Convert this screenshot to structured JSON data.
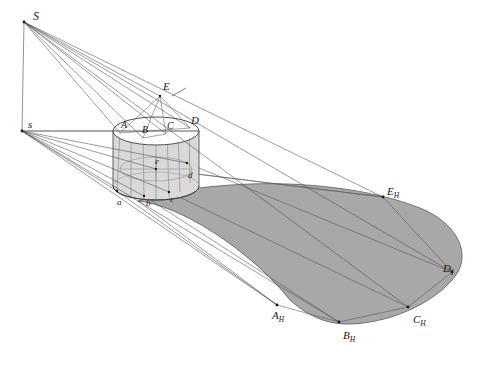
{
  "figure": {
    "background_color": "#ffffff",
    "line_color": "#3c3c3c",
    "shadow_fill": "#a8a8a8",
    "cylinder_fill": "#d8d8d8",
    "top_ellipse_fill": "#ffffff"
  },
  "labels": [
    {
      "id": "S",
      "text": "S",
      "sub": "",
      "x": 33,
      "y": 10,
      "size": 11
    },
    {
      "id": "s",
      "text": "s",
      "sub": "",
      "x": 28,
      "y": 119,
      "size": 10
    },
    {
      "id": "E",
      "text": "E",
      "sub": "",
      "x": 163,
      "y": 82,
      "size": 10
    },
    {
      "id": "A",
      "text": "A",
      "sub": "",
      "x": 122,
      "y": 121,
      "size": 10
    },
    {
      "id": "B",
      "text": "B",
      "sub": "",
      "x": 143,
      "y": 126,
      "size": 10
    },
    {
      "id": "C",
      "text": "C",
      "sub": "",
      "x": 168,
      "y": 122,
      "size": 10
    },
    {
      "id": "D",
      "text": "D",
      "sub": "",
      "x": 192,
      "y": 116,
      "size": 10
    },
    {
      "id": "e",
      "text": "e",
      "sub": "",
      "x": 155,
      "y": 158,
      "size": 9
    },
    {
      "id": "d",
      "text": "d",
      "sub": "",
      "x": 188,
      "y": 173,
      "size": 9
    },
    {
      "id": "a",
      "text": "a",
      "sub": "",
      "x": 117,
      "y": 199,
      "size": 9
    },
    {
      "id": "b",
      "text": "b",
      "sub": "",
      "x": 146,
      "y": 200,
      "size": 9
    },
    {
      "id": "c",
      "text": "c",
      "sub": "",
      "x": 170,
      "y": 196,
      "size": 9
    },
    {
      "id": "EH",
      "text": "E",
      "sub": "H",
      "x": 387,
      "y": 188,
      "size": 10
    },
    {
      "id": "DH",
      "text": "D",
      "sub": "I",
      "x": 443,
      "y": 265,
      "size": 10
    },
    {
      "id": "CH",
      "text": "C",
      "sub": "H",
      "x": 413,
      "y": 316,
      "size": 10
    },
    {
      "id": "BH",
      "text": "B",
      "sub": "H",
      "x": 343,
      "y": 332,
      "size": 10
    },
    {
      "id": "AH",
      "text": "A",
      "sub": "H",
      "x": 272,
      "y": 312,
      "size": 10
    }
  ],
  "points": {
    "S": [
      24,
      22
    ],
    "s": [
      22,
      131
    ],
    "E_top": [
      160,
      96
    ],
    "A_top": [
      120,
      133
    ],
    "B_top": [
      143,
      138
    ],
    "C_top": [
      166,
      134
    ],
    "D_top": [
      190,
      128
    ],
    "e_bot": [
      156,
      169
    ],
    "d_bot": [
      187,
      163
    ],
    "a_bot": [
      117,
      191
    ],
    "b_bot": [
      144,
      196
    ],
    "c_bot": [
      169,
      192
    ],
    "E_H": [
      383,
      197
    ],
    "D_H": [
      452,
      272
    ],
    "C_H": [
      408,
      307
    ],
    "B_H": [
      339,
      322
    ],
    "A_H": [
      277,
      305
    ]
  }
}
